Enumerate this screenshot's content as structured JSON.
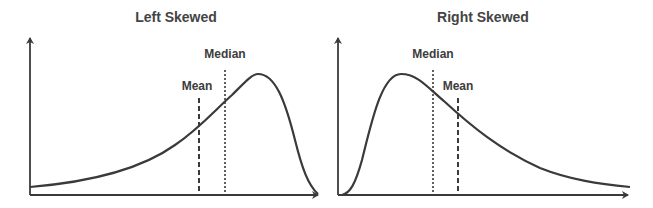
{
  "colors": {
    "line": "#3a3a3a",
    "text": "#444444",
    "background": "#ffffff"
  },
  "panels": [
    {
      "title": "Left Skewed",
      "markers": [
        {
          "label": "Mean",
          "style": "dashed"
        },
        {
          "label": "Median",
          "style": "dotted"
        }
      ]
    },
    {
      "title": "Right Skewed",
      "markers": [
        {
          "label": "Median",
          "style": "dotted"
        },
        {
          "label": "Mean",
          "style": "dashed"
        }
      ]
    }
  ]
}
